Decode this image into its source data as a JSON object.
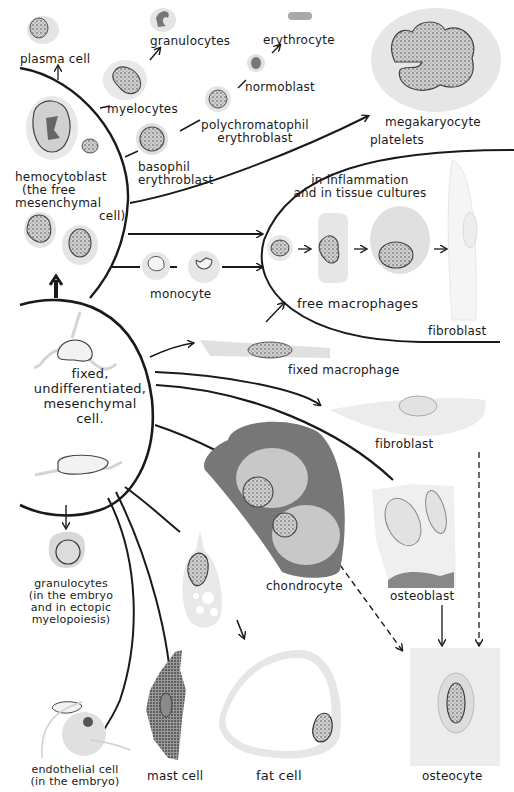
{
  "labels": {
    "plasma_cell": "plasma cell",
    "granulocytes_top": "granulocytes",
    "erythrocyte": "erythrocyte",
    "myelocytes": "myelocytes",
    "normoblast": "normoblast",
    "polychromatophil_1": "polychromatophil",
    "polychromatophil_2": "erythroblast",
    "basophil_1": "basophil",
    "basophil_2": "erythroblast",
    "megakaryocyte": "megakaryocyte",
    "platelets": "platelets",
    "hemocytoblast_1": "hemocytoblast",
    "hemocytoblast_2": "(the free",
    "hemocytoblast_3": "mesenchymal",
    "hemocytoblast_4": "cell)",
    "inflammation_1": "in inflammation",
    "inflammation_2": "and in tissue cultures",
    "monocyte": "monocyte",
    "free_macrophages": "free macrophages",
    "fibroblast_top": "fibroblast",
    "fixed_cell_1": "fixed,",
    "fixed_cell_2": "undifferentiated,",
    "fixed_cell_3": "mesenchymal",
    "fixed_cell_4": "cell.",
    "fixed_macrophage": "fixed macrophage",
    "fibroblast_mid": "fibroblast",
    "granulocytes_emb_1": "granulocytes",
    "granulocytes_emb_2": "(in the embryo",
    "granulocytes_emb_3": "and in ectopic",
    "granulocytes_emb_4": "myelopoiesis)",
    "chondrocyte": "chondrocyte",
    "osteoblast": "osteoblast",
    "endothelial_1": "endothelial cell",
    "endothelial_2": "(in the embryo)",
    "mast_cell": "mast cell",
    "fat_cell": "fat cell",
    "osteocyte": "osteocyte"
  },
  "colors": {
    "ink": "#1a1a1a",
    "cytoplasm": "#d9d9d9",
    "cartilage_matrix": "#7a7a7a",
    "cartilage_lacuna": "#c8c8c8",
    "nucleus": "#9a9a9a"
  }
}
